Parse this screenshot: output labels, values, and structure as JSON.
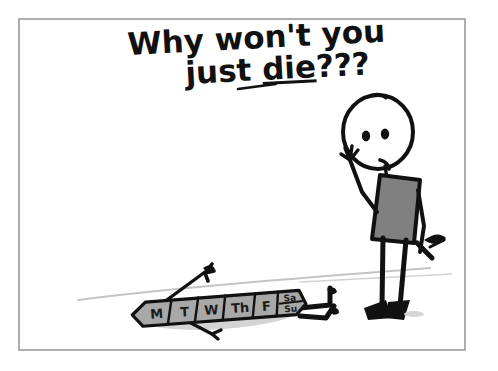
{
  "scene": {
    "title": "Why won't you just die???",
    "medium": "hand-drawn marker cartoon on white paper",
    "border_color": "#9a9a9a",
    "background_color": "#ffffff",
    "ink_color": "#111111"
  },
  "caption": {
    "line1": "Why won't you",
    "line2_before": "just ",
    "line2_underlined": "die",
    "line2_after": "???",
    "full_text": "Why won't you just die???",
    "underlined_word": "die"
  },
  "figure": {
    "name": "stick-figure-person",
    "pose": "standing, looking down, left hand raised in exasperation",
    "torso_color": "#808080",
    "torso_outline_color": "#111111",
    "head_color": "#ffffff",
    "eye_count": "2",
    "mouth": "frown",
    "held_object": "hammer",
    "held_object_hand": "right"
  },
  "victim": {
    "name": "weekday-calendar-bar",
    "description": "flattened weekly day-of-week bar lying on the ground",
    "fill_color": "#a8a8a8",
    "outline_color": "#111111",
    "cells": [
      {
        "label": "M"
      },
      {
        "label": "T"
      },
      {
        "label": "W"
      },
      {
        "label": "Th"
      },
      {
        "label": "F"
      }
    ],
    "weekend_cell": {
      "top_label": "Sa",
      "bottom_label": "Su"
    },
    "limbs": "two arms flung up and two legs with feet splayed out"
  },
  "ground": {
    "line_color": "#bdbdbd",
    "shadow_color": "#c9c9c9"
  }
}
